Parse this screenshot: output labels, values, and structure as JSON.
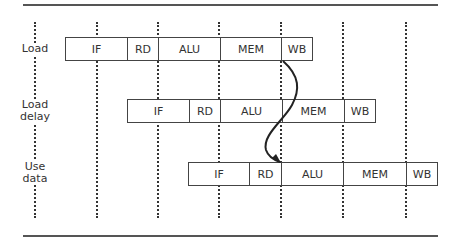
{
  "diagram": {
    "rows": [
      {
        "label": "Load",
        "stages": [
          "IF",
          "RD",
          "ALU",
          "MEM",
          "WB"
        ]
      },
      {
        "label": "Load\ndelay",
        "label_lines": [
          "Load",
          "delay"
        ],
        "stages": [
          "IF",
          "RD",
          "ALU",
          "MEM",
          "WB"
        ]
      },
      {
        "label": "Use\ndata",
        "label_lines": [
          "Use",
          "data"
        ],
        "stages": [
          "IF",
          "RD",
          "ALU",
          "MEM",
          "WB"
        ]
      }
    ],
    "arrow": {
      "from": "Load.WB",
      "to": "Use data.ALU",
      "description": "forwarding of loaded value"
    },
    "colors": {
      "lines": "#333333",
      "text": "#333333",
      "background": "#ffffff"
    }
  }
}
